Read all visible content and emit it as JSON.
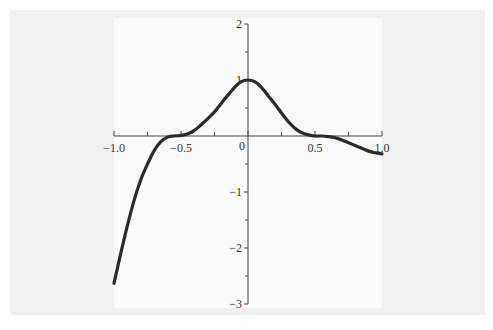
{
  "chart_data": {
    "type": "line",
    "title": "",
    "xlabel": "",
    "ylabel": "",
    "xlim": [
      -1.0,
      1.0
    ],
    "ylim": [
      -3,
      2
    ],
    "grid": false,
    "legend": "none",
    "x_ticks": [
      {
        "value": -1.0,
        "label": "−1.0"
      },
      {
        "value": -0.5,
        "label": "−0.5"
      },
      {
        "value": 0,
        "label": "0"
      },
      {
        "value": 0.5,
        "label": "0.5"
      },
      {
        "value": 1.0,
        "label": "1.0"
      }
    ],
    "x_minor_ticks": [
      -0.75,
      -0.25,
      0.25,
      0.75
    ],
    "y_ticks": [
      {
        "value": 2,
        "label": "2"
      },
      {
        "value": 1,
        "label": "1"
      },
      {
        "value": -1,
        "label": "−1"
      },
      {
        "value": -2,
        "label": "−2"
      },
      {
        "value": -3,
        "label": "−3"
      }
    ],
    "y_minor_ticks": [
      1.5,
      0.5,
      -0.5,
      -1.5,
      -2.5
    ],
    "series": [
      {
        "name": "f(x)",
        "color": "#2a2a2a",
        "x": [
          -1.0,
          -0.95,
          -0.9,
          -0.85,
          -0.8,
          -0.75,
          -0.7,
          -0.65,
          -0.6,
          -0.55,
          -0.5,
          -0.45,
          -0.4,
          -0.35,
          -0.3,
          -0.25,
          -0.2,
          -0.15,
          -0.1,
          -0.05,
          0.0,
          0.05,
          0.1,
          0.15,
          0.2,
          0.25,
          0.3,
          0.35,
          0.4,
          0.45,
          0.5,
          0.55,
          0.6,
          0.65,
          0.7,
          0.75,
          0.8,
          0.85,
          0.9,
          0.95,
          1.0
        ],
        "y": [
          -2.63,
          -2.1,
          -1.6,
          -1.15,
          -0.78,
          -0.5,
          -0.26,
          -0.1,
          -0.02,
          0.0,
          0.01,
          0.04,
          0.1,
          0.2,
          0.31,
          0.43,
          0.58,
          0.73,
          0.87,
          0.97,
          1.0,
          0.97,
          0.87,
          0.72,
          0.57,
          0.41,
          0.26,
          0.14,
          0.06,
          0.02,
          0.0,
          0.0,
          -0.01,
          -0.03,
          -0.07,
          -0.12,
          -0.17,
          -0.22,
          -0.27,
          -0.3,
          -0.32
        ]
      }
    ]
  }
}
